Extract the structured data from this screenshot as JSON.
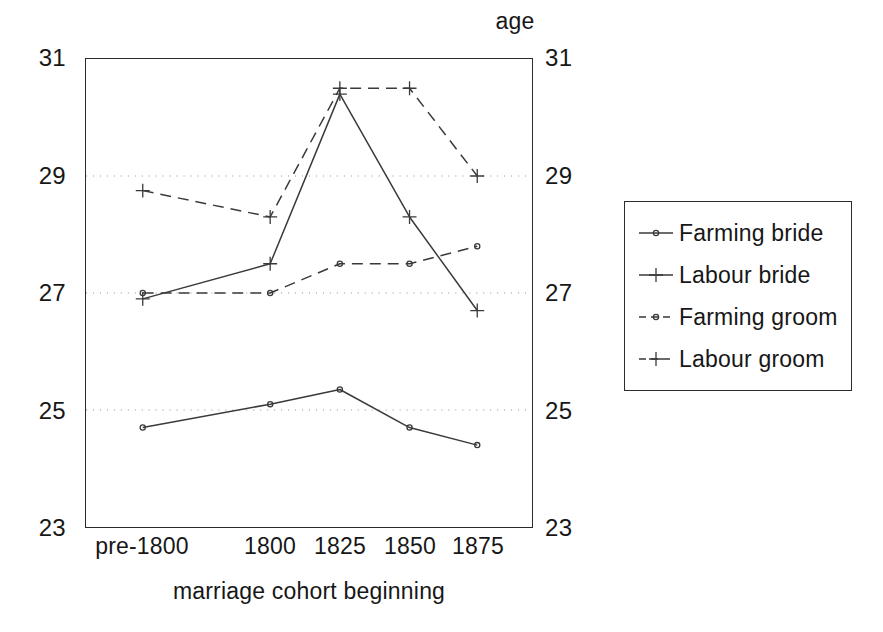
{
  "chart_data": {
    "type": "line",
    "title": "",
    "top_axis_title": "age",
    "xlabel": "marriage cohort beginning",
    "ylabel": "age",
    "categories": [
      "pre-1800",
      "1800",
      "1825",
      "1850",
      "1875"
    ],
    "ylim": [
      23,
      31
    ],
    "yticks": [
      23,
      25,
      27,
      29,
      31
    ],
    "ytick_labels_left": [
      "31",
      "29",
      "27",
      "25",
      "23"
    ],
    "ytick_labels_right": [
      "31",
      "29",
      "27",
      "25",
      "23"
    ],
    "gridlines_y": [
      25,
      27,
      29
    ],
    "grid": "dotted horizontal gridlines at 25, 27 and 29",
    "legend_position": "right, outside plot",
    "series": [
      {
        "name": "Farming bride",
        "line_style": "solid",
        "marker": "circle",
        "color": "#3a3a3a",
        "values": [
          24.7,
          25.1,
          25.35,
          24.7,
          24.4
        ]
      },
      {
        "name": "Labour bride",
        "line_style": "solid",
        "marker": "plus",
        "color": "#3a3a3a",
        "values": [
          26.9,
          27.5,
          30.4,
          28.3,
          26.7
        ]
      },
      {
        "name": "Farming groom",
        "line_style": "dashed",
        "marker": "circle",
        "color": "#3a3a3a",
        "values": [
          27.0,
          27.0,
          27.5,
          27.5,
          27.8
        ]
      },
      {
        "name": "Labour groom",
        "line_style": "dashed",
        "marker": "plus",
        "color": "#3a3a3a",
        "values": [
          28.75,
          28.3,
          30.5,
          30.5,
          29.0
        ]
      }
    ]
  },
  "legend": {
    "items": [
      {
        "label": "Farming bride"
      },
      {
        "label": "Labour bride"
      },
      {
        "label": "Farming groom"
      },
      {
        "label": "Labour groom"
      }
    ]
  }
}
